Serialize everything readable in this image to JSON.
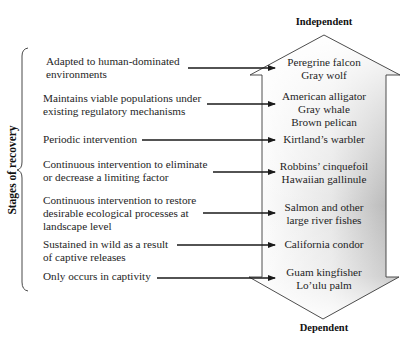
{
  "axis": {
    "title": "Stages of recovery",
    "top_label": "Independent",
    "bottom_label": "Dependent"
  },
  "colors": {
    "arrow_fill_light": "#ffffff",
    "arrow_fill_dark": "#b4b4b4",
    "line": "#1a1a1a"
  },
  "stages": [
    {
      "lines": [
        "Adapted to human-dominated",
        "environments"
      ],
      "species": [
        "Peregrine falcon",
        "Gray wolf"
      ]
    },
    {
      "lines": [
        "Maintains viable populations under",
        "existing regulatory mechanisms"
      ],
      "species": [
        "American alligator",
        "Gray whale",
        "Brown pelican"
      ]
    },
    {
      "lines": [
        "Periodic intervention"
      ],
      "species": [
        "Kirtland’s warbler"
      ]
    },
    {
      "lines": [
        "Continuous intervention to eliminate",
        "or decrease a limiting factor"
      ],
      "species": [
        "Robbins’ cinquefoil",
        "Hawaiian gallinule"
      ]
    },
    {
      "lines": [
        "Continuous intervention to restore",
        "desirable ecological processes at",
        "landscape level"
      ],
      "species": [
        "Salmon and other",
        "large river fishes"
      ]
    },
    {
      "lines": [
        "Sustained in wild as a result",
        "of captive releases"
      ],
      "species": [
        "California condor"
      ]
    },
    {
      "lines": [
        "Only occurs in captivity"
      ],
      "species": [
        "Guam kingfisher",
        "Lo’ulu palm"
      ]
    }
  ]
}
